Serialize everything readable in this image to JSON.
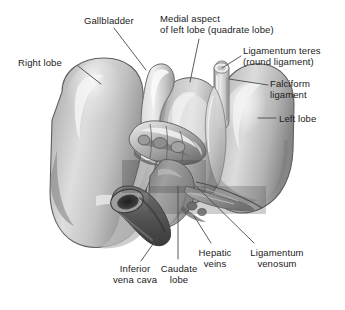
{
  "figure": {
    "type": "anatomical-illustration",
    "width": 345,
    "height": 310,
    "background_color": "#ffffff"
  },
  "palette": {
    "ink": "#1b1b1b",
    "leader_line": "#4a4a4a",
    "organ_light": "#d8d8d8",
    "organ_mid": "#b3b3b3",
    "organ_dark": "#8c8c8c",
    "organ_shadow": "#6e6e6e",
    "organ_outline": "#5a5a5a",
    "vessel_dark": "#636363",
    "vessel_darker": "#474747",
    "highlight": "#f2f2f2",
    "gallbladder": "#cfcfcf",
    "overlay_tint": "rgba(70,70,70,0.30)"
  },
  "labels": [
    {
      "id": "right-lobe",
      "text": "Right lobe",
      "x": 18,
      "y": 57,
      "align": "left",
      "leader": {
        "x1": 78,
        "y1": 66,
        "x2": 101,
        "y2": 84
      }
    },
    {
      "id": "gallbladder",
      "text": "Gallbladder",
      "x": 84,
      "y": 15,
      "align": "left",
      "leader": {
        "x1": 114,
        "y1": 28,
        "x2": 146,
        "y2": 70
      }
    },
    {
      "id": "medial-aspect-left-lobe",
      "text": "Medial aspect\nof left lobe (quadrate lobe)",
      "x": 160,
      "y": 13,
      "align": "left",
      "leader": {
        "x1": 199,
        "y1": 39,
        "x2": 190,
        "y2": 82
      }
    },
    {
      "id": "ligamentum-teres",
      "text": "Ligamentum teres\n(round ligament)",
      "x": 243,
      "y": 45,
      "align": "left",
      "leader": {
        "x1": 241,
        "y1": 56,
        "x2": 222,
        "y2": 68
      }
    },
    {
      "id": "falciform-ligament",
      "text": "Falciform\nligament",
      "x": 270,
      "y": 78,
      "align": "left",
      "leader": {
        "x1": 268,
        "y1": 85,
        "x2": 229,
        "y2": 79
      }
    },
    {
      "id": "left-lobe",
      "text": "Left lobe",
      "x": 279,
      "y": 113,
      "align": "left",
      "leader": {
        "x1": 276,
        "y1": 118,
        "x2": 258,
        "y2": 118
      }
    },
    {
      "id": "inferior-vena-cava",
      "text": "Inferior\nvena cava",
      "x": 104,
      "y": 263,
      "align": "center",
      "leader": {
        "x1": 141,
        "y1": 261,
        "x2": 158,
        "y2": 237
      }
    },
    {
      "id": "caudate-lobe",
      "text": "Caudate\nlobe",
      "x": 155,
      "y": 263,
      "align": "center",
      "leader": {
        "x1": 178,
        "y1": 259,
        "x2": 178,
        "y2": 186
      }
    },
    {
      "id": "hepatic-veins",
      "text": "Hepatic\nveins",
      "x": 191,
      "y": 247,
      "align": "center",
      "leader": {
        "x1": 211,
        "y1": 243,
        "x2": 194,
        "y2": 216
      }
    },
    {
      "id": "ligamentum-venosum",
      "text": "Ligamentum\nvenosum",
      "x": 241,
      "y": 247,
      "align": "center",
      "leader": {
        "x1": 254,
        "y1": 243,
        "x2": 196,
        "y2": 186
      }
    }
  ],
  "structures": [
    {
      "id": "right-lobe-body",
      "name": "right-lobe"
    },
    {
      "id": "left-lobe-body",
      "name": "left-lobe"
    },
    {
      "id": "quadrate-lobe-body",
      "name": "quadrate-lobe"
    },
    {
      "id": "gallbladder-body",
      "name": "gallbladder"
    },
    {
      "id": "inferior-vena-cava-vessel",
      "name": "inferior-vena-cava"
    },
    {
      "id": "porta-hepatis-cluster",
      "name": "porta-hepatis"
    },
    {
      "id": "ligamentum-teres-cord",
      "name": "ligamentum-teres"
    },
    {
      "id": "falciform-ligament-fold",
      "name": "falciform-ligament"
    },
    {
      "id": "caudate-lobe-body",
      "name": "caudate-lobe"
    },
    {
      "id": "hepatic-veins-group",
      "name": "hepatic-veins"
    },
    {
      "id": "ligamentum-venosum-fissure",
      "name": "ligamentum-venosum"
    }
  ],
  "overlays": [
    {
      "id": "overlay-upper",
      "x": 122,
      "y": 160,
      "width": 84,
      "height": 33
    },
    {
      "id": "overlay-lower",
      "x": 148,
      "y": 186,
      "width": 118,
      "height": 28
    }
  ]
}
